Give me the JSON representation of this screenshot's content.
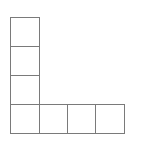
{
  "diagram": {
    "stroke_color": "#7a7a7a",
    "fill_color": "#ffffff",
    "cell_size": 29,
    "cells": [
      {
        "col": 0,
        "row": 0
      },
      {
        "col": 0,
        "row": 1
      },
      {
        "col": 0,
        "row": 2
      },
      {
        "col": 0,
        "row": 3
      },
      {
        "col": 1,
        "row": 3
      },
      {
        "col": 2,
        "row": 3
      },
      {
        "col": 3,
        "row": 3
      }
    ]
  }
}
